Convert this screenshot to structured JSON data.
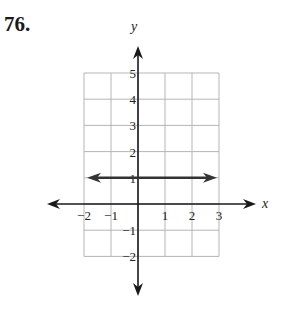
{
  "problem": {
    "number": "76."
  },
  "chart_data": {
    "type": "line",
    "title": "",
    "xlabel": "x",
    "ylabel": "y",
    "xlim": [
      -2,
      3
    ],
    "ylim": [
      -2,
      5
    ],
    "grid": true,
    "x_ticks": [
      "-2",
      "-1",
      "1",
      "2",
      "3"
    ],
    "y_ticks": [
      "5",
      "4",
      "3",
      "2",
      "1",
      "-1",
      "-2"
    ],
    "series": [
      {
        "name": "y = 1",
        "equation": "y = 1",
        "x": [
          -2,
          3
        ],
        "y": [
          1,
          1
        ],
        "arrows_both_ends": true
      }
    ]
  },
  "colors": {
    "grid": "#b5b5b5",
    "axis": "#1a1a1a",
    "line": "#333333"
  }
}
